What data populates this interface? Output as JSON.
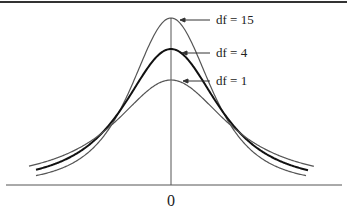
{
  "chart_data": {
    "type": "line",
    "title": "",
    "xlabel": "",
    "ylabel": "",
    "x_ticks": [
      "0"
    ],
    "grid": false,
    "legend_position": "inline-annotations-right",
    "series": [
      {
        "name": "df = 15",
        "df": 15,
        "peak_height_relative": 1.0,
        "stroke": "#555555",
        "stroke_width": 1.2
      },
      {
        "name": "df = 4",
        "df": 4,
        "peak_height_relative": 0.81,
        "stroke": "#111111",
        "stroke_width": 2.0
      },
      {
        "name": "df = 1",
        "df": 1,
        "peak_height_relative": 0.62,
        "stroke": "#555555",
        "stroke_width": 1.2
      }
    ],
    "annotations": [
      {
        "text": "df = 15",
        "points_to": "peak of df = 15 curve"
      },
      {
        "text": "df = 4",
        "points_to": "peak of df = 4 curve"
      },
      {
        "text": "df = 1",
        "points_to": "peak of df = 1 curve"
      }
    ]
  },
  "labels": {
    "df15": "df = 15",
    "df4": "df = 4",
    "df1": "df = 1",
    "zero": "0"
  },
  "colors": {
    "axis": "#555555",
    "thin_curve": "#555555",
    "bold_curve": "#111111",
    "top_rule": "#333333"
  }
}
